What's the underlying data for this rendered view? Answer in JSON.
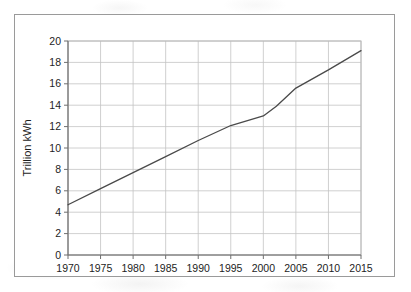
{
  "chart_data": {
    "type": "line",
    "title": "",
    "subtitle": "",
    "xlabel": "",
    "ylabel": "Trillion kWh",
    "xlim": [
      1970,
      2015
    ],
    "ylim": [
      0,
      20
    ],
    "grid": true,
    "legend": false,
    "legend_position": "none",
    "x_ticks": [
      1970,
      1975,
      1980,
      1985,
      1990,
      1995,
      2000,
      2005,
      2010,
      2015
    ],
    "y_ticks": [
      0,
      2,
      4,
      6,
      8,
      10,
      12,
      14,
      16,
      18,
      20
    ],
    "x_tick_labels": [
      "1970",
      "1975",
      "1980",
      "1985",
      "1990",
      "1995",
      "2000",
      "2005",
      "2010",
      "2015"
    ],
    "y_tick_labels": [
      "0",
      "2",
      "4",
      "6",
      "8",
      "10",
      "12",
      "14",
      "16",
      "18",
      "20"
    ],
    "series": [
      {
        "name": "World net electricity generation",
        "color": "#4a4a4a",
        "x": [
          1970,
          1975,
          1980,
          1985,
          1990,
          1995,
          2000,
          2002,
          2005,
          2010,
          2015
        ],
        "values": [
          4.7,
          6.2,
          7.7,
          9.2,
          10.7,
          12.1,
          13.0,
          13.9,
          15.6,
          17.3,
          19.1
        ]
      }
    ],
    "annotations": []
  },
  "style": {
    "frame_border_color": "#9a9a9a",
    "axis_color": "#6f6f6f",
    "grid_color": "#c4c4c4",
    "line_color": "#4a4a4a",
    "text_color": "#1d1d1d",
    "background_color": "#ffffff"
  }
}
